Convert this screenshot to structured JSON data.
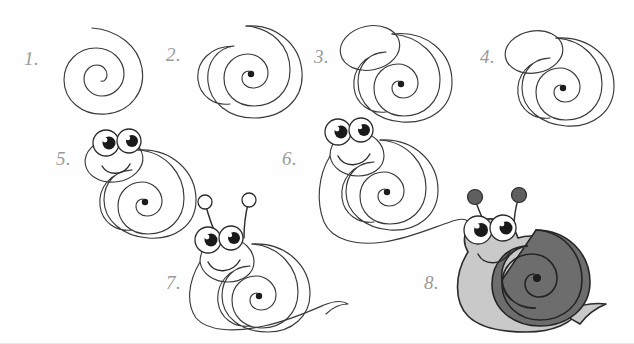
{
  "page": {
    "medium": "pencil and ink drawing on white paper",
    "background_color": "#fefefe",
    "ink_color": "#3a3a3a",
    "number_color": "#9a9a9a"
  },
  "palette": {
    "paper": "#fefefe",
    "ink": "#3a3a3a",
    "pencil_number": "#9a9a9a",
    "body_gray": "#c9c9c9",
    "head_gray": "#d6d6d6",
    "shell_gray": "#6d6d6d",
    "antenna_ball": "#5f5f5f",
    "pupil": "#1a1a1a",
    "eye_white": "#ffffff"
  },
  "steps": [
    {
      "number": "1.",
      "label": "open spiral",
      "description": "A loose open spiral curl drawn with a single line",
      "num_x": 24,
      "num_y": 48,
      "art_x": 50,
      "art_y": 22
    },
    {
      "number": "2.",
      "label": "closed shell outline",
      "description": "Spiral enclosed by a rounded shell outline, center dot filled",
      "num_x": 166,
      "num_y": 44,
      "art_x": 188,
      "art_y": 18
    },
    {
      "number": "3.",
      "label": "head oval added",
      "description": "An oval head shape overlapping the shell at upper left",
      "num_x": 314,
      "num_y": 46,
      "art_x": 330,
      "art_y": 10
    },
    {
      "number": "4.",
      "label": "head refined",
      "description": "Head oval tidied and joined to the shell outline",
      "num_x": 480,
      "num_y": 46,
      "art_x": 492,
      "art_y": 20
    },
    {
      "number": "5.",
      "label": "eyes and smile",
      "description": "Two big round eyes with pupils and a smiling mouth on the head",
      "num_x": 56,
      "num_y": 148,
      "art_x": 76,
      "art_y": 128
    },
    {
      "number": "6.",
      "label": "body and foot",
      "description": "Snail body and long curving foot drawn under the shell",
      "num_x": 282,
      "num_y": 148,
      "art_x": 300,
      "art_y": 118
    },
    {
      "number": "7.",
      "label": "antennae and tail",
      "description": "Two antennae with round tips and a pointed tail added",
      "num_x": 166,
      "num_y": 272,
      "art_x": 178,
      "art_y": 192
    },
    {
      "number": "8.",
      "label": "shaded and finished",
      "description": "Finished snail coloured in with light gray body and dark gray shell",
      "num_x": 424,
      "num_y": 272,
      "art_x": 440,
      "art_y": 186
    }
  ]
}
